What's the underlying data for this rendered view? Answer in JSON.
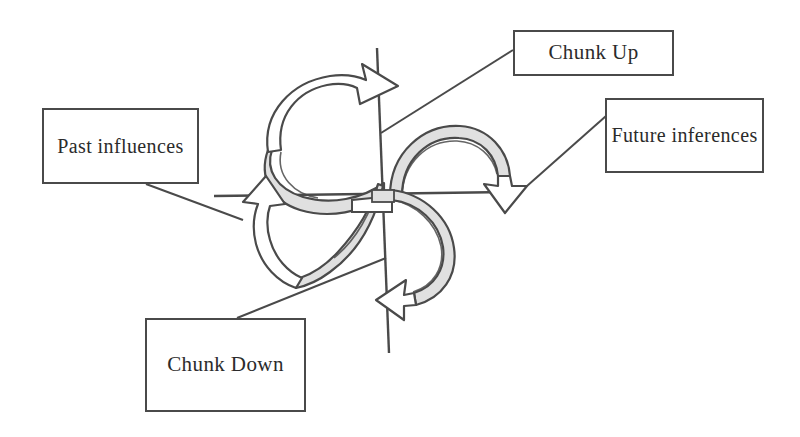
{
  "diagram": {
    "colors": {
      "stroke": "#4a4a4a",
      "ribbon_fill": "#e0e0e0",
      "background": "#ffffff",
      "text": "#2b2b2b"
    },
    "labels": [
      {
        "id": "chunk-up",
        "text": "Chunk Up",
        "lines": [
          "Chunk Up"
        ],
        "position": "top-right"
      },
      {
        "id": "past-influences",
        "text": "Past influences",
        "lines": [
          "Past",
          "influences"
        ],
        "position": "left"
      },
      {
        "id": "future-inferences",
        "text": "Future inferences",
        "lines": [
          "Future",
          "inferences"
        ],
        "position": "right"
      },
      {
        "id": "chunk-down",
        "text": "Chunk Down",
        "lines": [
          "Chunk Down"
        ],
        "position": "bottom-left"
      }
    ],
    "arrows": [
      {
        "id": "chunk-up-arrow",
        "direction": "up-right",
        "style": "3d-ribbon"
      },
      {
        "id": "past-influences-arrow",
        "direction": "up-left",
        "style": "outline"
      },
      {
        "id": "future-inferences-arrow",
        "direction": "down-right",
        "style": "outline"
      },
      {
        "id": "chunk-down-arrow",
        "direction": "down-left",
        "style": "3d-ribbon"
      }
    ],
    "axes": [
      {
        "id": "vertical-axis",
        "orientation": "vertical"
      },
      {
        "id": "horizontal-axis",
        "orientation": "horizontal"
      }
    ]
  }
}
